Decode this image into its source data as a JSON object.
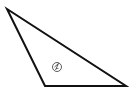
{
  "diagram": {
    "type": "triangle",
    "stroke_color": "#111111",
    "vertices": [
      {
        "name": "top",
        "x": 7,
        "y": 9
      },
      {
        "name": "bottom-left",
        "x": 45,
        "y": 86
      },
      {
        "name": "bottom-right",
        "x": 126,
        "y": 86
      }
    ],
    "angle_label": {
      "text": "1",
      "shape": "circle",
      "cx": 57,
      "cy": 67,
      "r": 4.5
    }
  }
}
